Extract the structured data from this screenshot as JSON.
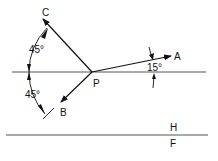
{
  "diagram": {
    "points": {
      "P": "P",
      "A": "A",
      "B": "B",
      "C": "C"
    },
    "angles": {
      "a_to_horizontal": "15°",
      "c_to_horizontal": "45°",
      "b_to_horizontal": "45°"
    },
    "regions": {
      "upper": "H",
      "lower": "F"
    },
    "colors": {
      "stroke": "#111111",
      "background": "#ffffff"
    }
  }
}
